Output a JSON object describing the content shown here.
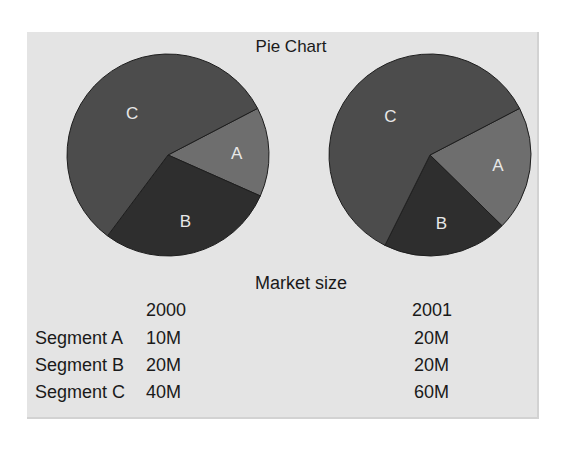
{
  "title": "Pie Chart",
  "subtitle": "Market size",
  "columns": [
    "2000",
    "2001"
  ],
  "rows": [
    {
      "label": "Segment A",
      "values": [
        "10M",
        "20M"
      ]
    },
    {
      "label": "Segment B",
      "values": [
        "20M",
        "20M"
      ]
    },
    {
      "label": "Segment C",
      "values": [
        "40M",
        "60M"
      ]
    }
  ],
  "slice_labels": [
    "A",
    "B",
    "C"
  ],
  "colors": {
    "A": "#6e6e6e",
    "B": "#2e2e2e",
    "C": "#4c4c4c",
    "panel": "#e4e4e4"
  },
  "chart_data": [
    {
      "type": "pie",
      "title": "Pie Chart — 2000",
      "categories": [
        "A",
        "B",
        "C"
      ],
      "values": [
        10,
        20,
        40
      ],
      "unit": "M"
    },
    {
      "type": "pie",
      "title": "Pie Chart — 2001",
      "categories": [
        "A",
        "B",
        "C"
      ],
      "values": [
        20,
        20,
        60
      ],
      "unit": "M"
    }
  ]
}
